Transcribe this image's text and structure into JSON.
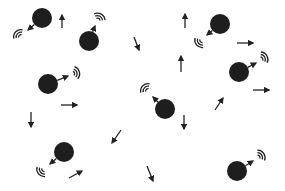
{
  "diagram": {
    "title": "",
    "colors": {
      "particle": "#1e1e1e",
      "ink": "#222222",
      "background": "#ffffff"
    },
    "particles": [
      {
        "id": "p1",
        "cx": 42,
        "cy": 18,
        "r": 10,
        "emit_to": [
          28,
          30
        ],
        "waves_at": [
          19,
          35
        ],
        "wave_dir": 225
      },
      {
        "id": "p2",
        "cx": 89,
        "cy": 41,
        "r": 10,
        "emit_to": [
          95,
          26
        ],
        "waves_at": [
          99,
          18
        ],
        "wave_dir": -60
      },
      {
        "id": "p3",
        "cx": 48,
        "cy": 84,
        "r": 10,
        "emit_to": [
          68,
          76
        ],
        "waves_at": [
          75,
          73
        ],
        "wave_dir": -15
      },
      {
        "id": "p4",
        "cx": 64,
        "cy": 152,
        "r": 10,
        "emit_to": [
          50,
          164
        ],
        "waves_at": [
          42,
          171
        ],
        "wave_dir": 140
      },
      {
        "id": "p5",
        "cx": 165,
        "cy": 109,
        "r": 10,
        "emit_to": [
          153,
          97
        ],
        "waves_at": [
          146,
          89
        ],
        "wave_dir": 225
      },
      {
        "id": "p6",
        "cx": 220,
        "cy": 24,
        "r": 10,
        "emit_to": [
          207,
          35
        ],
        "waves_at": [
          200,
          42
        ],
        "wave_dir": 140
      },
      {
        "id": "p7",
        "cx": 239,
        "cy": 72,
        "r": 10,
        "emit_to": [
          256,
          63
        ],
        "waves_at": [
          263,
          58
        ],
        "wave_dir": -30
      },
      {
        "id": "p8",
        "cx": 237,
        "cy": 171,
        "r": 10,
        "emit_to": [
          253,
          161
        ],
        "waves_at": [
          260,
          156
        ],
        "wave_dir": -35
      }
    ],
    "arrows": [
      {
        "id": "a1",
        "from": [
          62,
          28
        ],
        "to": [
          62,
          15
        ]
      },
      {
        "id": "a2",
        "from": [
          134,
          37
        ],
        "to": [
          139,
          50
        ]
      },
      {
        "id": "a3",
        "from": [
          185,
          28
        ],
        "to": [
          185,
          14
        ]
      },
      {
        "id": "a4",
        "from": [
          237,
          43
        ],
        "to": [
          253,
          43
        ]
      },
      {
        "id": "a5",
        "from": [
          181,
          72
        ],
        "to": [
          181,
          56
        ]
      },
      {
        "id": "a6",
        "from": [
          61,
          105
        ],
        "to": [
          77,
          105
        ]
      },
      {
        "id": "a7",
        "from": [
          253,
          90
        ],
        "to": [
          269,
          90
        ]
      },
      {
        "id": "a8",
        "from": [
          215,
          110
        ],
        "to": [
          223,
          98
        ]
      },
      {
        "id": "a9",
        "from": [
          31,
          112
        ],
        "to": [
          31,
          127
        ]
      },
      {
        "id": "a10",
        "from": [
          184,
          115
        ],
        "to": [
          184,
          129
        ]
      },
      {
        "id": "a11",
        "from": [
          121,
          130
        ],
        "to": [
          112,
          143
        ]
      },
      {
        "id": "a12",
        "from": [
          69,
          178
        ],
        "to": [
          82,
          171
        ]
      },
      {
        "id": "a13",
        "from": [
          147,
          166
        ],
        "to": [
          153,
          181
        ]
      }
    ]
  }
}
